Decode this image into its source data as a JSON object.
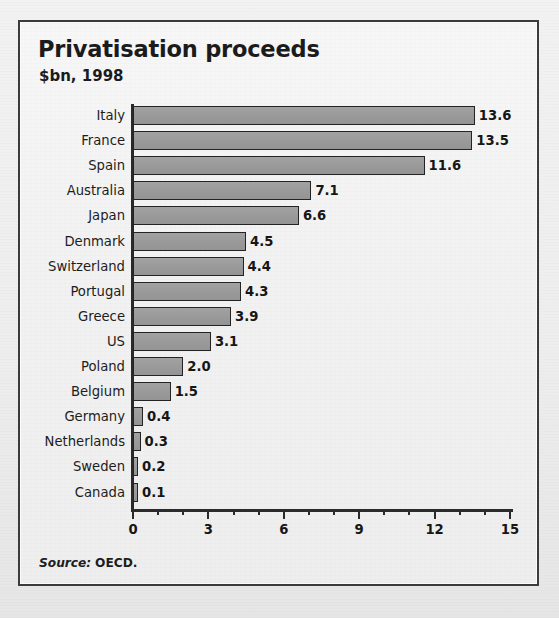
{
  "frame": {
    "title": "Privatisation proceeds",
    "subtitle": "$bn, 1998",
    "source_word": "Source:",
    "source_value": "OECD."
  },
  "colors": {
    "bar_fill": "#9a9a9a",
    "bar_outline": "#232323",
    "axis": "#2a2a2a",
    "text": "#1b1b1b",
    "panel_bg": "#f2f2f2"
  },
  "chart_data": {
    "type": "bar",
    "orientation": "horizontal",
    "title": "Privatisation proceeds",
    "subtitle": "$bn, 1998",
    "xlabel": "",
    "ylabel": "",
    "xlim": [
      0,
      15
    ],
    "grid": false,
    "legend": null,
    "xticks_major": [
      "0",
      "3",
      "6",
      "9",
      "12",
      "15"
    ],
    "xticks_major_values": [
      0,
      3,
      6,
      9,
      12,
      15
    ],
    "xtick_minor_step": 1,
    "value_label_format": "one decimal",
    "source": "Source: OECD.",
    "categories": [
      "Italy",
      "France",
      "Spain",
      "Australia",
      "Japan",
      "Denmark",
      "Switzerland",
      "Portugal",
      "Greece",
      "US",
      "Poland",
      "Belgium",
      "Germany",
      "Netherlands",
      "Sweden",
      "Canada"
    ],
    "values": [
      13.6,
      13.5,
      11.6,
      7.1,
      6.6,
      4.5,
      4.4,
      4.3,
      3.9,
      3.1,
      2.0,
      1.5,
      0.4,
      0.3,
      0.2,
      0.1
    ],
    "value_labels": [
      "13.6",
      "13.5",
      "11.6",
      "7.1",
      "6.6",
      "4.5",
      "4.4",
      "4.3",
      "3.9",
      "3.1",
      "2.0",
      "1.5",
      "0.4",
      "0.3",
      "0.2",
      "0.1"
    ]
  }
}
